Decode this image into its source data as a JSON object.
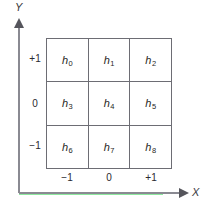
{
  "chart_data": {
    "type": "table",
    "title": "",
    "xlabel": "X",
    "ylabel": "Y",
    "grid": true,
    "rows": 3,
    "cols": 3,
    "x_tick_labels": [
      "−1",
      "0",
      "+1"
    ],
    "y_tick_labels": [
      "+1",
      "0",
      "−1"
    ],
    "xlim": [
      -1,
      1
    ],
    "ylim": [
      -1,
      1
    ],
    "cells": [
      {
        "base": "h",
        "sub": "0",
        "x": "−1",
        "y": "+1"
      },
      {
        "base": "h",
        "sub": "1",
        "x": "0",
        "y": "+1"
      },
      {
        "base": "h",
        "sub": "2",
        "x": "+1",
        "y": "+1"
      },
      {
        "base": "h",
        "sub": "3",
        "x": "−1",
        "y": "0"
      },
      {
        "base": "h",
        "sub": "4",
        "x": "0",
        "y": "0"
      },
      {
        "base": "h",
        "sub": "5",
        "x": "+1",
        "y": "0"
      },
      {
        "base": "h",
        "sub": "6",
        "x": "−1",
        "y": "−1"
      },
      {
        "base": "h",
        "sub": "7",
        "x": "0",
        "y": "−1"
      },
      {
        "base": "h",
        "sub": "8",
        "x": "+1",
        "y": "−1"
      }
    ],
    "values": [
      "h0",
      "h1",
      "h2",
      "h3",
      "h4",
      "h5",
      "h6",
      "h7",
      "h8"
    ],
    "colors": {
      "axis": "#8a8a92",
      "arrow": "#55555c",
      "grid_line": "#6d6d74",
      "text": "#1f1f24",
      "accent_green": "#8fe8a0",
      "background": "#ffffff"
    }
  },
  "axes": {
    "y_label": "Y",
    "x_label": "X"
  }
}
